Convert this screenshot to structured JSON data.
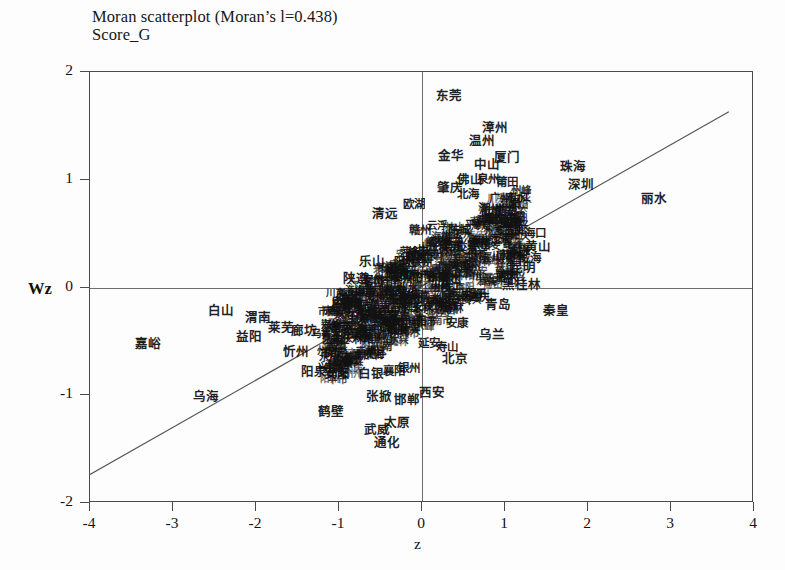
{
  "figure": {
    "title_line1": "Moran scatterplot (Moran’s l=0.438)",
    "title_line2": "Score_G"
  },
  "chart_data": {
    "type": "scatter",
    "title": "Moran scatterplot (Moran’s l=0.438)",
    "subtitle": "Score_G",
    "xlabel": "z",
    "ylabel": "Wz",
    "xlim": [
      -4,
      4
    ],
    "ylim": [
      -2,
      2
    ],
    "xticks": [
      "-4",
      "-3",
      "-2",
      "-1",
      "0",
      "1",
      "2",
      "3",
      "4"
    ],
    "yticks": [
      "2",
      "1",
      "0",
      "-1",
      "-2"
    ],
    "grid": false,
    "legend": "none",
    "morans_i": 0.438,
    "reference_lines": {
      "horizontal_y": 0,
      "vertical_x": 0
    },
    "regression_line": {
      "slope": 0.438,
      "intercept": 0.0,
      "x_start": -4.0,
      "x_end": 3.72
    },
    "point_label_type": "city-name-chinese",
    "points": [
      {
        "label": "东莞",
        "x": 0.33,
        "y": 1.78,
        "size": "s-lg"
      },
      {
        "label": "漳州",
        "x": 0.88,
        "y": 1.48,
        "size": "s-lg"
      },
      {
        "label": "温州",
        "x": 0.72,
        "y": 1.36,
        "size": "s-lg"
      },
      {
        "label": "金华",
        "x": 0.35,
        "y": 1.22,
        "size": "s-lg"
      },
      {
        "label": "厦门",
        "x": 1.03,
        "y": 1.2,
        "size": "s-lg"
      },
      {
        "label": "中山",
        "x": 0.78,
        "y": 1.14,
        "size": "s-lg"
      },
      {
        "label": "珠海",
        "x": 1.82,
        "y": 1.12,
        "size": "s-lg"
      },
      {
        "label": "佛山",
        "x": 0.58,
        "y": 1.0,
        "size": "s-lg"
      },
      {
        "label": "泉州",
        "x": 0.8,
        "y": 1.0,
        "size": "s-md"
      },
      {
        "label": "莆田",
        "x": 1.02,
        "y": 0.97,
        "size": "s-md"
      },
      {
        "label": "肇庆",
        "x": 0.34,
        "y": 0.92,
        "size": "s-lg"
      },
      {
        "label": "深圳",
        "x": 1.92,
        "y": 0.95,
        "size": "s-lg"
      },
      {
        "label": "北海",
        "x": 0.56,
        "y": 0.86,
        "size": "s-md"
      },
      {
        "label": "广州",
        "x": 0.94,
        "y": 0.82,
        "size": "s-md"
      },
      {
        "label": "丽水",
        "x": 2.8,
        "y": 0.82,
        "size": "s-lg"
      },
      {
        "label": "欧湖",
        "x": -0.1,
        "y": 0.77,
        "size": "s-md"
      },
      {
        "label": "潮州",
        "x": 0.82,
        "y": 0.72,
        "size": "s-md"
      },
      {
        "label": "清远",
        "x": -0.45,
        "y": 0.68,
        "size": "s-lg"
      },
      {
        "label": "潮州",
        "x": 1.0,
        "y": 0.66,
        "size": "s-md"
      },
      {
        "label": "云浮",
        "x": 0.18,
        "y": 0.58,
        "size": "s-sm"
      },
      {
        "label": "赣州",
        "x": -0.02,
        "y": 0.52,
        "size": "s-md"
      },
      {
        "label": "防城",
        "x": 0.45,
        "y": 0.52,
        "size": "s-md"
      },
      {
        "label": "三亚",
        "x": 1.12,
        "y": 0.52,
        "size": "s-md"
      },
      {
        "label": "海口",
        "x": 1.36,
        "y": 0.5,
        "size": "s-md"
      },
      {
        "label": "梁东",
        "x": 0.36,
        "y": 0.38,
        "size": "s-md"
      },
      {
        "label": "萍乡",
        "x": -0.14,
        "y": 0.34,
        "size": "s-sm"
      },
      {
        "label": "黄山",
        "x": 1.4,
        "y": 0.38,
        "size": "s-lg"
      },
      {
        "label": "乐山",
        "x": -0.6,
        "y": 0.24,
        "size": "s-lg"
      },
      {
        "label": "威海",
        "x": 1.3,
        "y": 0.26,
        "size": "s-md"
      },
      {
        "label": "昆明",
        "x": 1.22,
        "y": 0.18,
        "size": "s-lg"
      },
      {
        "label": "临沂",
        "x": -0.3,
        "y": 0.12,
        "size": "s-md"
      },
      {
        "label": "黄冈",
        "x": -0.26,
        "y": 0.1,
        "size": "s-md"
      },
      {
        "label": "齐南",
        "x": -0.38,
        "y": 0.06,
        "size": "s-sm"
      },
      {
        "label": "黑桂林",
        "x": 1.2,
        "y": 0.02,
        "size": "s-lg"
      },
      {
        "label": "陕遵",
        "x": -0.8,
        "y": 0.08,
        "size": "s-lg"
      },
      {
        "label": "荆州",
        "x": -0.55,
        "y": -0.04,
        "size": "s-md"
      },
      {
        "label": "陇南",
        "x": -0.52,
        "y": -0.2,
        "size": "s-md"
      },
      {
        "label": "石家庄",
        "x": -0.2,
        "y": -0.18,
        "size": "s-sm"
      },
      {
        "label": "宜宾",
        "x": -0.28,
        "y": -0.26,
        "size": "s-sm"
      },
      {
        "label": "白山",
        "x": -2.42,
        "y": -0.22,
        "size": "s-lg"
      },
      {
        "label": "渭南",
        "x": -1.98,
        "y": -0.28,
        "size": "s-lg"
      },
      {
        "label": "莱芜",
        "x": -1.7,
        "y": -0.38,
        "size": "s-lg"
      },
      {
        "label": "廊坊",
        "x": -1.42,
        "y": -0.4,
        "size": "s-lg"
      },
      {
        "label": "乌鲁木齐",
        "x": -1.1,
        "y": -0.42,
        "size": "s-sm"
      },
      {
        "label": "青岛",
        "x": 0.92,
        "y": -0.16,
        "size": "s-lg"
      },
      {
        "label": "秦皇",
        "x": 1.62,
        "y": -0.22,
        "size": "s-lg"
      },
      {
        "label": "安康",
        "x": 0.42,
        "y": -0.34,
        "size": "s-md"
      },
      {
        "label": "乌兰",
        "x": 0.84,
        "y": -0.44,
        "size": "s-lg"
      },
      {
        "label": "延安",
        "x": 0.08,
        "y": -0.52,
        "size": "s-md"
      },
      {
        "label": "寿山",
        "x": 0.3,
        "y": -0.56,
        "size": "s-md"
      },
      {
        "label": "北京",
        "x": 0.4,
        "y": -0.66,
        "size": "s-lg"
      },
      {
        "label": "嘉峪",
        "x": -3.3,
        "y": -0.52,
        "size": "s-lg"
      },
      {
        "label": "益阳",
        "x": -2.08,
        "y": -0.46,
        "size": "s-lg"
      },
      {
        "label": "忻州",
        "x": -1.52,
        "y": -0.6,
        "size": "s-lg"
      },
      {
        "label": "保定",
        "x": -1.05,
        "y": -0.62,
        "size": "s-md"
      },
      {
        "label": "阳泉",
        "x": -1.3,
        "y": -0.78,
        "size": "s-lg"
      },
      {
        "label": "安阳",
        "x": -1.02,
        "y": -0.8,
        "size": "s-lg"
      },
      {
        "label": "白银",
        "x": -0.62,
        "y": -0.8,
        "size": "s-lg"
      },
      {
        "label": "襄阳",
        "x": -0.34,
        "y": -0.78,
        "size": "s-md"
      },
      {
        "label": "银州",
        "x": -0.16,
        "y": -0.76,
        "size": "s-md"
      },
      {
        "label": "乌海",
        "x": -2.6,
        "y": -1.02,
        "size": "s-lg"
      },
      {
        "label": "鹤壁",
        "x": -1.1,
        "y": -1.16,
        "size": "s-lg"
      },
      {
        "label": "张掀",
        "x": -0.52,
        "y": -1.02,
        "size": "s-lg"
      },
      {
        "label": "西安",
        "x": 0.12,
        "y": -0.98,
        "size": "s-lg"
      },
      {
        "label": "邯郸",
        "x": -0.18,
        "y": -1.04,
        "size": "s-lg"
      },
      {
        "label": "太原",
        "x": -0.3,
        "y": -1.26,
        "size": "s-lg"
      },
      {
        "label": "武威",
        "x": -0.54,
        "y": -1.32,
        "size": "s-lg"
      },
      {
        "label": "通化",
        "x": -0.42,
        "y": -1.44,
        "size": "s-lg"
      }
    ]
  }
}
